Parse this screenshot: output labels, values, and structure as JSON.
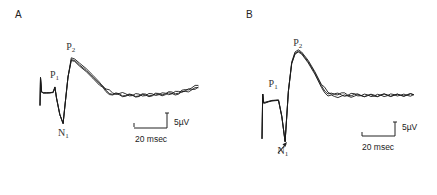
{
  "chart_data": [
    {
      "type": "line",
      "panel": "A",
      "title": "A",
      "xunit": "msec",
      "yunit": "µV",
      "scale_bar": {
        "x_value": 20,
        "x_label": "20 msec",
        "y_value": 5,
        "y_label": "5µV"
      },
      "peak_labels": [
        {
          "name": "P",
          "sub": "1",
          "t": 9,
          "v": 3.8
        },
        {
          "name": "N",
          "sub": "1",
          "t": 14,
          "v": -10.5
        },
        {
          "name": "P",
          "sub": "2",
          "t": 19,
          "v": 13.0
        }
      ],
      "series": [
        {
          "name": "trace-1",
          "t": [
            0,
            0.3,
            1,
            2,
            4,
            6,
            8,
            9,
            10,
            12,
            14,
            15,
            17,
            19,
            21,
            24,
            28,
            32,
            36,
            40,
            44,
            48,
            52,
            56,
            60,
            64,
            68,
            72,
            76,
            80,
            84,
            88,
            92,
            96
          ],
          "v": [
            -4.5,
            4.8,
            0.2,
            -0.4,
            -0.2,
            -0.3,
            0,
            1.6,
            -2,
            -7.5,
            -10.5,
            -5,
            5,
            10.8,
            10.5,
            9,
            7.2,
            5,
            2.8,
            0.6,
            -0.8,
            -0.6,
            -1.2,
            -0.9,
            -1.3,
            -0.7,
            -1.1,
            -0.5,
            -0.6,
            0,
            -0.4,
            0.8,
            1.4,
            2.2
          ]
        },
        {
          "name": "trace-2",
          "t": [
            0,
            0.3,
            1,
            2,
            4,
            6,
            8,
            9,
            10,
            12,
            14,
            15,
            17,
            19,
            21,
            24,
            28,
            32,
            36,
            40,
            44,
            48,
            52,
            56,
            60,
            64,
            68,
            72,
            76,
            80,
            84,
            88,
            92,
            96
          ],
          "v": [
            -4.5,
            4.8,
            0,
            -0.2,
            -0.3,
            -0.2,
            -0.1,
            1.7,
            -2,
            -7.5,
            -10.5,
            -5,
            5,
            11.4,
            11,
            9.6,
            7.8,
            5.6,
            3.3,
            1,
            -0.3,
            -0.5,
            -0.6,
            -1.2,
            -0.7,
            -1.2,
            -0.6,
            -0.9,
            -0.4,
            -0.6,
            0.2,
            0.4,
            0.9,
            1.7
          ]
        },
        {
          "name": "trace-3",
          "t": [
            0,
            0.3,
            1,
            2,
            4,
            6,
            8,
            9,
            10,
            12,
            14,
            15,
            17,
            19,
            21,
            24,
            28,
            32,
            36,
            40,
            44,
            48,
            52,
            56,
            60,
            64,
            68,
            72,
            76,
            80,
            84,
            88,
            92,
            96
          ],
          "v": [
            -4.5,
            4.8,
            -0.1,
            -0.3,
            -0.4,
            -0.3,
            -0.2,
            1.5,
            -2,
            -7.5,
            -10.5,
            -5,
            5,
            10.5,
            10.2,
            8.6,
            6.8,
            4.6,
            2.3,
            0.1,
            -1,
            -0.9,
            -1.4,
            -1.1,
            -1.5,
            -1,
            -1.3,
            -0.8,
            -0.9,
            -0.5,
            -0.7,
            0.2,
            0.7,
            1.4
          ]
        }
      ]
    },
    {
      "type": "line",
      "panel": "B",
      "title": "B",
      "xunit": "msec",
      "yunit": "µV",
      "scale_bar": {
        "x_value": 20,
        "x_label": "20 msec",
        "y_value": 5,
        "y_label": "5µV"
      },
      "annotations": [
        {
          "type": "arrow",
          "t": 9,
          "v": -5,
          "note": "arrow pointing to N1 descending limb"
        }
      ],
      "peak_labels": [
        {
          "name": "P",
          "sub": "1",
          "t": 7,
          "v": 6.5
        },
        {
          "name": "N",
          "sub": "1",
          "t": 12.5,
          "v": -12
        },
        {
          "name": "P",
          "sub": "2",
          "t": 22,
          "v": 21
        }
      ],
      "series": [
        {
          "name": "trace-1",
          "t": [
            0,
            0.4,
            1,
            2,
            4,
            6,
            8,
            10,
            12,
            14,
            16,
            18,
            20,
            22,
            24,
            28,
            32,
            36,
            40,
            44,
            48,
            52,
            56,
            60,
            64,
            68,
            72,
            76,
            80,
            84,
            88,
            92
          ],
          "v": [
            -11,
            5,
            1.8,
            1.9,
            2.3,
            2.6,
            2.7,
            2.8,
            -3,
            -12,
            6,
            16,
            19.5,
            20.3,
            19.6,
            16.5,
            12.6,
            8,
            5,
            4.8,
            5.4,
            4.6,
            4.9,
            4.4,
            4.5,
            4.2,
            4.7,
            4.5,
            4.6,
            4.5,
            4.8,
            4.7
          ]
        },
        {
          "name": "trace-2",
          "t": [
            0,
            0.4,
            1,
            2,
            4,
            6,
            8,
            10,
            12,
            14,
            16,
            18,
            20,
            22,
            24,
            28,
            32,
            36,
            40,
            44,
            48,
            52,
            56,
            60,
            64,
            68,
            72,
            76,
            80,
            84,
            88,
            92
          ],
          "v": [
            -11,
            5,
            2,
            2.1,
            2.4,
            2.7,
            2.8,
            2.9,
            -3,
            -12,
            6,
            16.4,
            20,
            20.8,
            20,
            17,
            13,
            8.4,
            5.6,
            5.1,
            4.7,
            4.5,
            5.1,
            4.4,
            4.7,
            4.3,
            4.6,
            4.4,
            4.8,
            4.6,
            4.5,
            4.8
          ]
        },
        {
          "name": "trace-3",
          "t": [
            0,
            0.4,
            1,
            2,
            4,
            6,
            8,
            10,
            12,
            14,
            16,
            18,
            20,
            22,
            24,
            28,
            32,
            36,
            40,
            44,
            48,
            52,
            56,
            60,
            64,
            68,
            72,
            76,
            80,
            84,
            88,
            92
          ],
          "v": [
            -11,
            5,
            1.7,
            1.8,
            2.2,
            2.5,
            2.6,
            2.7,
            -3,
            -12,
            6,
            15.8,
            19.2,
            20,
            19.3,
            16.1,
            12.1,
            7.4,
            4.3,
            4.1,
            4.2,
            4.3,
            4.2,
            4.5,
            4.4,
            4.6,
            4.5,
            4.7,
            4.5,
            4.6,
            4.6,
            4.7
          ]
        }
      ]
    }
  ]
}
